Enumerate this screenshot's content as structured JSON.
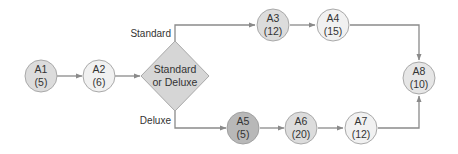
{
  "diagram": {
    "type": "activity-network",
    "colors": {
      "line": "#8a8a8a",
      "node_stroke": "#a9a9a9",
      "node_light": "#f1f1f1",
      "node_mid": "#dcdcdc",
      "node_dark": "#b8b8b8",
      "decision_fill": "#d6d6d6",
      "text": "#333333"
    },
    "nodes": [
      {
        "id": "A1",
        "label": "A1",
        "duration": "(5)"
      },
      {
        "id": "A2",
        "label": "A2",
        "duration": "(6)"
      },
      {
        "id": "A3",
        "label": "A3",
        "duration": "(12)"
      },
      {
        "id": "A4",
        "label": "A4",
        "duration": "(15)"
      },
      {
        "id": "A5",
        "label": "A5",
        "duration": "(5)"
      },
      {
        "id": "A6",
        "label": "A6",
        "duration": "(20)"
      },
      {
        "id": "A7",
        "label": "A7",
        "duration": "(12)"
      },
      {
        "id": "A8",
        "label": "A8",
        "duration": "(10)"
      }
    ],
    "decision": {
      "line1": "Standard",
      "line2": "or Deluxe"
    },
    "branches": {
      "top": "Standard",
      "bottom": "Deluxe"
    },
    "edges": [
      [
        "A1",
        "A2"
      ],
      [
        "A2",
        "decision"
      ],
      [
        "decision",
        "A3"
      ],
      [
        "A3",
        "A4"
      ],
      [
        "A4",
        "A8"
      ],
      [
        "decision",
        "A5"
      ],
      [
        "A5",
        "A6"
      ],
      [
        "A6",
        "A7"
      ],
      [
        "A7",
        "A8"
      ]
    ]
  }
}
